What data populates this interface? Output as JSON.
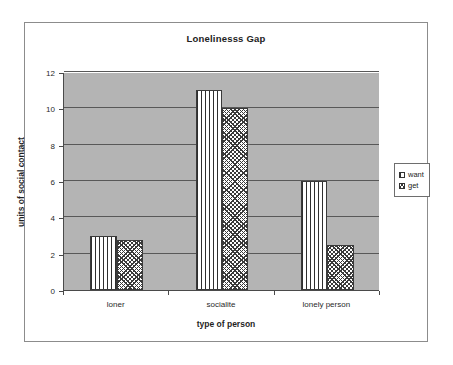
{
  "chart_data": {
    "type": "bar",
    "title": "Lonelinesss Gap",
    "xlabel": "type of person",
    "ylabel": "units of social contact",
    "categories": [
      "loner",
      "socialite",
      "lonely person"
    ],
    "series": [
      {
        "name": "want",
        "values": [
          3,
          11,
          6
        ],
        "pattern": "vertical-stripes"
      },
      {
        "name": "get",
        "values": [
          2.75,
          10,
          2.5
        ],
        "pattern": "wave-texture"
      }
    ],
    "ylim": [
      0,
      12
    ],
    "yticks": [
      0,
      2,
      4,
      6,
      8,
      10,
      12
    ],
    "ytick_labels": [
      "0",
      "2",
      "4",
      "6",
      "8",
      "10",
      "12"
    ],
    "grid": true,
    "legend_position": "right",
    "plot_background_color": "#b4b4b4",
    "axis_color": "#4a4a4a",
    "gridline_color": "#585858",
    "frame_color": "#8c8c8c",
    "page_background_color": "#ffffff"
  },
  "legend": {
    "entries": [
      {
        "label": "want"
      },
      {
        "label": "get"
      }
    ]
  }
}
